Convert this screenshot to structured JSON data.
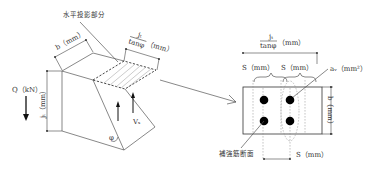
{
  "left_figure": {
    "horizontal_projection_label": "水平投影部分",
    "b_label": "b（mm）",
    "jt_over_tan_label": {
      "numerator": "jₜ",
      "denominator": "tanφ",
      "unit": "（mm）"
    },
    "Q_label": "Q（kN）",
    "jt_label": "jₜ（mm）",
    "Vs_label": "Vₛ",
    "phi_label": "φ"
  },
  "right_figure": {
    "jt_over_tan_label": {
      "numerator": "jₜ",
      "denominator": "tanφ",
      "unit": "（mm）"
    },
    "S_label_1": "S（mm）",
    "S_label_2": "S（mm）",
    "aw_label": "aᵥ（mm²）",
    "b_label": "b（mm）",
    "rebar_section_label": "補強筋断面",
    "S_bottom_label": "S（mm）",
    "rebar_count": 4
  },
  "colors": {
    "line": "#555555",
    "text": "#333333",
    "rebar": "#000000"
  }
}
